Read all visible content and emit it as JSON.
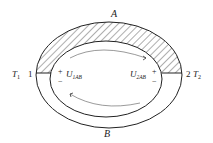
{
  "diagram": {
    "type": "thermocouple-circuit",
    "labels": {
      "top_conductor": "A",
      "bottom_conductor": "B",
      "left_temp": "T",
      "left_temp_sub": "1",
      "left_node": "1",
      "right_node": "2",
      "right_temp": "T",
      "right_temp_sub": "2",
      "left_emf": "U",
      "left_emf_sub": "1AB",
      "right_emf": "U",
      "right_emf_sub": "2AB",
      "plus": "+",
      "minus": "−"
    },
    "colors": {
      "stroke": "#222222",
      "background": "#ffffff"
    }
  }
}
